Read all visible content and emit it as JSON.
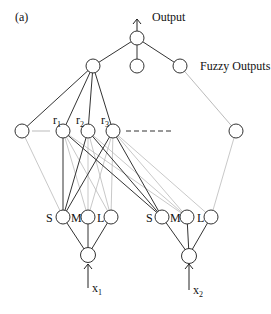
{
  "figure": {
    "panel_label": "(a)",
    "output_label": "Output",
    "fuzzy_outputs_label": "Fuzzy Outputs",
    "rule_labels": [
      {
        "base": "r",
        "sub": "1"
      },
      {
        "base": "r",
        "sub": "2"
      },
      {
        "base": "r",
        "sub": "3"
      }
    ],
    "membership_labels_input1": [
      "S",
      "M",
      "L"
    ],
    "membership_labels_input2": [
      "S",
      "M",
      "L"
    ],
    "inputs": [
      {
        "base": "x",
        "sub": "1"
      },
      {
        "base": "x",
        "sub": "2"
      }
    ]
  }
}
